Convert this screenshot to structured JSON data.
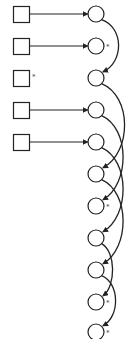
{
  "diagram": {
    "stroke_color": "#222222",
    "background": "#ffffff",
    "mark_glyph": "*",
    "squares": [
      {
        "id": "s1",
        "cx": 21,
        "cy": 14,
        "marked": false,
        "arrow_to": "c1"
      },
      {
        "id": "s2",
        "cx": 21,
        "cy": 46,
        "marked": false,
        "arrow_to": "c2"
      },
      {
        "id": "s3",
        "cx": 21,
        "cy": 78,
        "marked": true,
        "arrow_to": null
      },
      {
        "id": "s4",
        "cx": 21,
        "cy": 110,
        "marked": false,
        "arrow_to": "c4"
      },
      {
        "id": "s5",
        "cx": 21,
        "cy": 142,
        "marked": false,
        "arrow_to": "c5"
      }
    ],
    "circles": [
      {
        "id": "c1",
        "cx": 96,
        "cy": 14,
        "marked": false
      },
      {
        "id": "c2",
        "cx": 96,
        "cy": 46,
        "marked": true
      },
      {
        "id": "c3",
        "cx": 96,
        "cy": 78,
        "marked": false
      },
      {
        "id": "c4",
        "cx": 96,
        "cy": 110,
        "marked": false
      },
      {
        "id": "c5",
        "cx": 96,
        "cy": 142,
        "marked": false
      },
      {
        "id": "c6",
        "cx": 96,
        "cy": 174,
        "marked": false
      },
      {
        "id": "c7",
        "cx": 96,
        "cy": 206,
        "marked": true
      },
      {
        "id": "c8",
        "cx": 96,
        "cy": 238,
        "marked": false
      },
      {
        "id": "c9",
        "cx": 96,
        "cy": 270,
        "marked": false
      },
      {
        "id": "c10",
        "cx": 96,
        "cy": 302,
        "marked": true
      },
      {
        "id": "c11",
        "cx": 96,
        "cy": 332,
        "marked": true
      }
    ],
    "arcs": [
      {
        "from": "c1",
        "to": "c3",
        "bulge": 22
      },
      {
        "from": "c3",
        "to": "c6",
        "bulge": 30
      },
      {
        "from": "c4",
        "to": "c7",
        "bulge": 28
      },
      {
        "from": "c5",
        "to": "c8",
        "bulge": 28
      },
      {
        "from": "c6",
        "to": "c9",
        "bulge": 28
      },
      {
        "from": "c8",
        "to": "c10",
        "bulge": 14
      },
      {
        "from": "c9",
        "to": "c11",
        "bulge": 18
      }
    ]
  }
}
